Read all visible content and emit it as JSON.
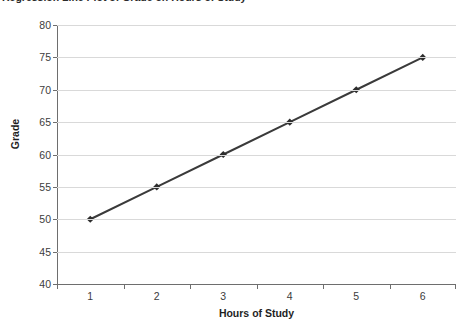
{
  "title": {
    "text": "Regression Line Plot of Grade on Hours of Study",
    "clipped": true
  },
  "axis": {
    "y_title": "Grade",
    "x_title": "Hours of Study"
  },
  "colors": {
    "series_line": "#3a3a3a",
    "marker": "#2d2d2d",
    "gridline": "#d9d9d9",
    "axis_line": "#6e6e6e",
    "tick_text": "#3c3c3c",
    "axis_title_text": "#1f1f1f",
    "background": "#ffffff"
  },
  "chart_data": {
    "type": "line",
    "title": "Regression Line Plot of Grade on Hours of Study",
    "xlabel": "Hours of Study",
    "ylabel": "Grade",
    "categories": [
      "1",
      "2",
      "3",
      "4",
      "5",
      "6"
    ],
    "x": [
      1,
      2,
      3,
      4,
      5,
      6
    ],
    "values": [
      50,
      55,
      60,
      65,
      70,
      75
    ],
    "series": [
      {
        "name": "Grade",
        "values": [
          50,
          55,
          60,
          65,
          70,
          75
        ]
      }
    ],
    "ylim": [
      40,
      80
    ],
    "yticks": [
      40,
      45,
      50,
      55,
      60,
      65,
      70,
      75,
      80
    ],
    "ytick_labels": [
      "40",
      "45",
      "50",
      "55",
      "60",
      "65",
      "70",
      "75",
      "80"
    ],
    "xtick_labels": [
      "1",
      "2",
      "3",
      "4",
      "5",
      "6"
    ],
    "grid": "horizontal",
    "legend": "none",
    "marker": "diamond",
    "line_width": 2
  }
}
